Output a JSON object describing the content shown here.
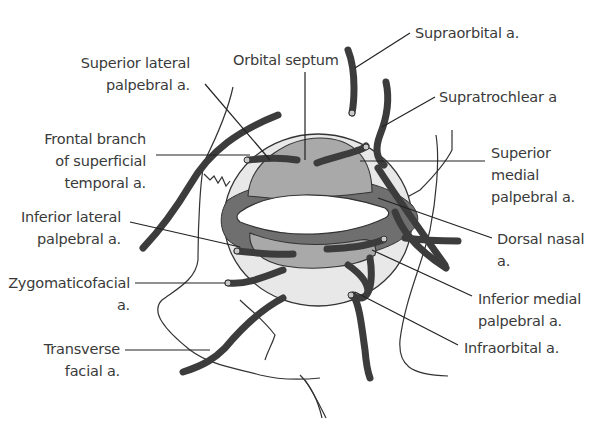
{
  "figure": {
    "type": "anatomical-diagram",
    "colors": {
      "artery": "#3c3c3c",
      "tarsal_plate": "#a8a8a8",
      "arcade": "#6e6e6e",
      "septum_fill": "#e6e6e6",
      "outline": "#333333",
      "background": "#ffffff"
    }
  },
  "labels": {
    "orbital_septum": "Orbital septum",
    "supraorbital": "Supraorbital a.",
    "supratrochlear": "Supratrochlear a",
    "superior_lateral_palpebral": "Superior lateral\npalpebral a.",
    "frontal_branch": "Frontal branch\nof superficial\ntemporal a.",
    "superior_medial_palpebral": "Superior\nmedial\npalpebral a.",
    "inferior_lateral_palpebral": "Inferior lateral\npalpebral a.",
    "dorsal_nasal": "Dorsal nasal\na.",
    "zygomaticofacial": "Zygomaticofacial\na.",
    "inferior_medial_palpebral": "Inferior medial\npalpebral a.",
    "transverse_facial": "Transverse\nfacial a.",
    "infraorbital": "Infraorbital a."
  }
}
